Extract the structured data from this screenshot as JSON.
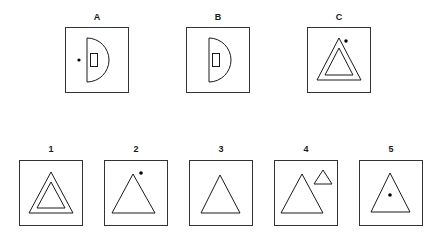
{
  "puzzle": {
    "type": "visual-analogy-matrix",
    "colors": {
      "background": "#ffffff",
      "box_border": "#333333",
      "shape_stroke": "#1a1a1a",
      "dot_fill": "#000000",
      "label_text": "#1a1a1a"
    },
    "stem_row": {
      "name": "stem-row",
      "cells": [
        {
          "label": "A",
          "shape_description": "half-disc (semicircle) opening right with small vertical rectangle inside and a small dot to the left"
        },
        {
          "label": "B",
          "shape_description": "half-disc (semicircle) opening right with small vertical rectangle inside, no dot"
        },
        {
          "label": "C",
          "shape_description": "nested double triangle with a small dot above the right side of the apex"
        }
      ]
    },
    "options_row": {
      "name": "options-row",
      "cells": [
        {
          "label": "1",
          "shape_description": "nested double triangle, no dot"
        },
        {
          "label": "2",
          "shape_description": "single triangle with a small dot above and right of the apex"
        },
        {
          "label": "3",
          "shape_description": "single plain triangle"
        },
        {
          "label": "4",
          "shape_description": "large single triangle with a small triangle at upper right"
        },
        {
          "label": "5",
          "shape_description": "single triangle with a small dot centered inside"
        }
      ]
    }
  }
}
